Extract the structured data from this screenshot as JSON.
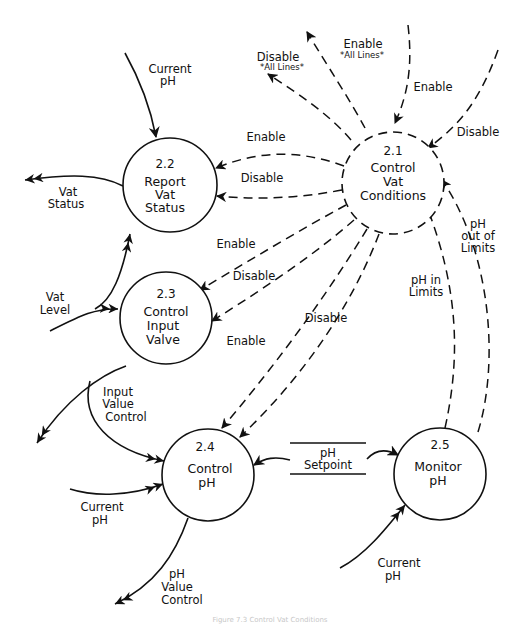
{
  "diagram": {
    "type": "data-flow-diagram",
    "processes": [
      {
        "id": "2.1",
        "number": "2.1",
        "lines": [
          "Control",
          "Vat",
          "Conditions"
        ]
      },
      {
        "id": "2.2",
        "number": "2.2",
        "lines": [
          "Report",
          "Vat",
          "Status"
        ]
      },
      {
        "id": "2.3",
        "number": "2.3",
        "lines": [
          "Control",
          "Input",
          "Valve"
        ]
      },
      {
        "id": "2.4",
        "number": "2.4",
        "lines": [
          "Control",
          "pH"
        ]
      },
      {
        "id": "2.5",
        "number": "2.5",
        "lines": [
          "Monitor",
          "pH"
        ]
      }
    ],
    "data_store": {
      "lines": [
        "pH",
        "Setpoint"
      ]
    },
    "data_flows": [
      {
        "label_lines": [
          "Current",
          "pH"
        ],
        "from": "external",
        "to": "2.2"
      },
      {
        "label_lines": [
          "Vat",
          "Status"
        ],
        "from": "2.2",
        "to": "external"
      },
      {
        "label_lines": [
          "Vat",
          "Level"
        ],
        "from": "external",
        "to": "2.2 / 2.3"
      },
      {
        "label_lines": [
          "Input",
          "Value",
          "Control"
        ],
        "from": "2.3",
        "to": "2.4 / external"
      },
      {
        "label_lines": [
          "Current",
          "pH"
        ],
        "from": "external",
        "to": "2.4"
      },
      {
        "label_lines": [
          "pH",
          "Value",
          "Control"
        ],
        "from": "2.4",
        "to": "external"
      },
      {
        "label_lines": [
          "Current",
          "pH"
        ],
        "from": "external",
        "to": "2.5"
      }
    ],
    "control_flows": [
      {
        "label": "Disable",
        "sublabel": "*All Lines*",
        "from": "2.1",
        "to": "external"
      },
      {
        "label": "Enable",
        "sublabel": "*All Lines*",
        "from": "2.1",
        "to": "external"
      },
      {
        "label": "Enable",
        "from": "external",
        "to": "2.1"
      },
      {
        "label": "Disable",
        "from": "external",
        "to": "2.1"
      },
      {
        "label": "Enable",
        "from": "2.1",
        "to": "2.2"
      },
      {
        "label": "Disable",
        "from": "2.1",
        "to": "2.2"
      },
      {
        "label": "Enable",
        "from": "2.1",
        "to": "2.3"
      },
      {
        "label": "Disable",
        "from": "2.1",
        "to": "2.3"
      },
      {
        "label": "Enable",
        "from": "2.1",
        "to": "2.4"
      },
      {
        "label": "Disable",
        "from": "2.1",
        "to": "2.4"
      },
      {
        "label": "pH in Limits",
        "label_lines": [
          "pH in",
          "Limits"
        ],
        "from": "2.5",
        "to": "2.1"
      },
      {
        "label": "pH out of Limits",
        "label_lines": [
          "pH",
          "out of",
          "Limits"
        ],
        "from": "2.5",
        "to": "2.1"
      }
    ]
  },
  "labels": {
    "current_ph_top": [
      "Current",
      "pH"
    ],
    "vat_status": [
      "Vat",
      "Status"
    ],
    "vat_level": [
      "Vat",
      "Level"
    ],
    "input_value_control": [
      "Input",
      "Value",
      "Control"
    ],
    "current_ph_24": [
      "Current",
      "pH"
    ],
    "ph_value_control": [
      "pH",
      "Value",
      "Control"
    ],
    "current_ph_25": [
      "Current",
      "pH"
    ],
    "disable_all": "Disable",
    "disable_all_sub": "*All Lines*",
    "enable_all": "Enable",
    "enable_all_sub": "*All Lines*",
    "enable_in": "Enable",
    "disable_in": "Disable",
    "enable_22": "Enable",
    "disable_22": "Disable",
    "enable_23": "Enable",
    "disable_23": "Disable",
    "enable_24": "Enable",
    "disable_24": "Disable",
    "ph_in_limits": [
      "pH in",
      "Limits"
    ],
    "ph_out_limits": [
      "pH",
      "out of",
      "Limits"
    ],
    "setpoint": [
      "pH",
      "Setpoint"
    ]
  },
  "caption": "Figure 7.3  Control Vat Conditions"
}
